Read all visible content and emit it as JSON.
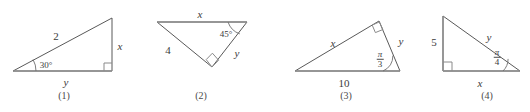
{
  "figure": {
    "kind": "geometry-triangles-worksheet",
    "background_color": "#ffffff",
    "line_color": "#595959",
    "base_line_color": "#8f8f8f",
    "text_color": "#3b3b3b",
    "captions": [
      "(1)",
      "(2)",
      "(3)",
      "(4)"
    ],
    "triangles": [
      {
        "caption": "(1)",
        "description": "right triangle, right angle at bottom right, 30 degree angle at left",
        "labels": {
          "hypotenuse": "2",
          "vertical_leg": "x",
          "horizontal_leg": "y",
          "angle": "30°"
        }
      },
      {
        "caption": "(2)",
        "description": "inverted triangle with right angle at bottom apex and 45 degree angle at top right",
        "labels": {
          "top_side": "x",
          "left_side": "4",
          "right_side": "y",
          "angle": "45°"
        }
      },
      {
        "caption": "(3)",
        "description": "triangle with right angle at top vertex and pi/3 angle at bottom right",
        "labels": {
          "long_side": "x",
          "base": "10",
          "right_side": "y",
          "angle_numerator": "π",
          "angle_denominator": "3"
        }
      },
      {
        "caption": "(4)",
        "description": "right triangle, right angle at bottom left, pi/4 angle at bottom right",
        "labels": {
          "vertical_leg": "5",
          "hypotenuse": "y",
          "base": "x",
          "angle_numerator": "π",
          "angle_denominator": "4"
        }
      }
    ]
  }
}
